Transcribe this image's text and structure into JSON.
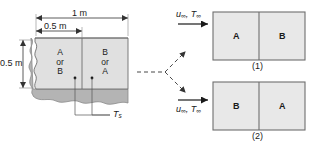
{
  "figure": {
    "colors": {
      "slab_fill": "#e0e0e0",
      "slab_edge_dark": "#9a9a9a",
      "panel_fill": "#e8e8e8",
      "line": "#333333",
      "background": "#ffffff"
    }
  },
  "slab": {
    "name": "composite-slab",
    "width_label": "1 m",
    "half_width_label": "0.5 m",
    "height_label": "0.5 m",
    "surface_temp_label": "T",
    "surface_temp_sub": "s",
    "left_block": {
      "line1": "A",
      "line2": "or",
      "line3": "B"
    },
    "right_block": {
      "line1": "B",
      "line2": "or",
      "line3": "A"
    }
  },
  "panels": [
    {
      "id": "panel-1",
      "caption": "(1)",
      "flow_velocity": "u",
      "flow_velocity_sub": "∞",
      "flow_temp": "T",
      "flow_temp_sub": "∞",
      "left_letter": "A",
      "right_letter": "B"
    },
    {
      "id": "panel-2",
      "caption": "(2)",
      "flow_velocity": "u",
      "flow_velocity_sub": "∞",
      "flow_temp": "T",
      "flow_temp_sub": "∞",
      "left_letter": "B",
      "right_letter": "A"
    }
  ]
}
